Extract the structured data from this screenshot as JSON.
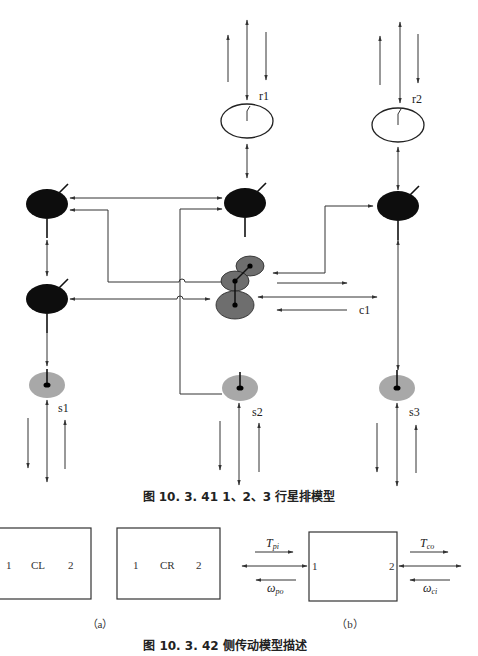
{
  "figure1": {
    "caption": "图 10. 3. 41   1、2、3 行星排模型",
    "labels": {
      "r1": "r1",
      "r2": "r2",
      "c1": "c1",
      "s1": "s1",
      "s2": "s2",
      "s3": "s3"
    }
  },
  "figure2": {
    "caption": "图 10. 3. 42   侧传动模型描述",
    "panel_a": {
      "label": "（a）",
      "boxes": [
        {
          "port_left": "1",
          "name": "CL",
          "port_right": "2"
        },
        {
          "port_left": "1",
          "name": "CR",
          "port_right": "2"
        }
      ]
    },
    "panel_b": {
      "label": "（b）",
      "port_left": "1",
      "port_right": "2",
      "signals": {
        "t_in": {
          "base": "T",
          "sub": "pi"
        },
        "w_out": {
          "base": "ω",
          "sub": "po"
        },
        "t_out": {
          "base": "T",
          "sub": "co"
        },
        "w_in": {
          "base": "ω",
          "sub": "ci"
        }
      }
    }
  },
  "colors": {
    "dark_gear": "#0d0d0d",
    "planet_gear": "#6e6e6e",
    "sun_gear": "#a8a8a8",
    "line": "#333333"
  }
}
